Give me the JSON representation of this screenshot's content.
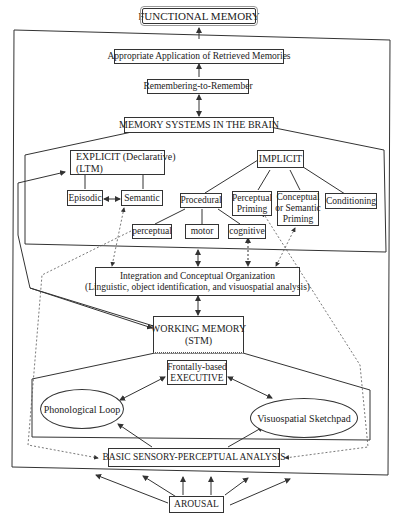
{
  "diagram": {
    "title": "FUNCTIONAL MEMORY",
    "nodes": {
      "appropriate_application": "Appropriate Application of Retrieved Memories",
      "remembering": "Remembering-to-Remember",
      "memory_systems": "MEMORY SYSTEMS IN THE BRAIN",
      "explicit_line1": "EXPLICIT  (Declarative)",
      "explicit_line2": "(LTM)",
      "episodic": "Episodic",
      "semantic": "Semantic",
      "implicit": "IMPLICIT",
      "procedural": "Procedural",
      "perceptual_priming_line1": "Perceptual",
      "perceptual_priming_line2": "Priming",
      "conceptual_priming_line1": "Conceptual",
      "conceptual_priming_line2": "or Semantic",
      "conceptual_priming_line3": "Priming",
      "conditioning": "Conditioning",
      "perceptual": "perceptual",
      "motor": "motor",
      "cognitive": "cognitive",
      "integration_line1": "Integration and Conceptual Organization",
      "integration_line2": "(Linguistic, object identification, and visuospatial analysis)",
      "working_memory_line1": "WORKING MEMORY",
      "working_memory_line2": "(STM)",
      "executive_line1": "Frontally-based",
      "executive_line2": "EXECUTIVE",
      "phonological_loop": "Phonological Loop",
      "visuospatial_sketchpad": "Visuospatial Sketchpad",
      "basic_sensory": "BASIC SENSORY-PERCEPTUAL ANALYSIS",
      "arousal": "AROUSAL"
    },
    "colors": {
      "line": "#333333",
      "dashed": "#555555",
      "background": "#ffffff"
    }
  }
}
